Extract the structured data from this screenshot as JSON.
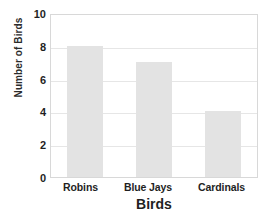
{
  "chart_data": {
    "type": "bar",
    "title": "",
    "title_cropped": true,
    "categories": [
      "Robins",
      "Blue Jays",
      "Cardinals"
    ],
    "values": [
      8,
      7,
      4
    ],
    "xlabel": "Birds",
    "ylabel": "Number of Birds",
    "ylim": [
      0,
      10
    ],
    "yticks": [
      0,
      2,
      4,
      6,
      8,
      10
    ],
    "ytick_labels": [
      "0",
      "2",
      "4",
      "6",
      "8",
      "10"
    ],
    "grid": true,
    "grid_axis": "y",
    "legend": false,
    "bar_color": "#e3e3e3",
    "frame_color": "#d8d8d8",
    "grid_color": "#e6e6e6",
    "text_color": "#1f1f1f",
    "background": "#ffffff"
  }
}
